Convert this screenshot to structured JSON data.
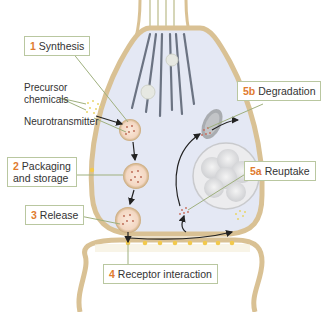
{
  "diagram": {
    "type": "synaptic transmission process",
    "colors": {
      "membrane": "#d9c194",
      "membrane_edge": "#c4a874",
      "cytoplasm": "#e4e8f4",
      "microtubule": "#6b7382",
      "step_number": "#e07b2f",
      "leader_line": "#9fb07e",
      "vesicle_fill": "#f6dcc8",
      "receptor_dot": "#f2c94c"
    },
    "steps": [
      {
        "number": "1",
        "label": "Synthesis"
      },
      {
        "number": "2",
        "label_line1": "Packaging",
        "label_line2": "and storage"
      },
      {
        "number": "3",
        "label": "Release"
      },
      {
        "number": "4",
        "label": "Receptor interaction"
      },
      {
        "number": "5a",
        "label": "Reuptake"
      },
      {
        "number": "5b",
        "label": "Degradation"
      }
    ],
    "annotations": {
      "precursor_line1": "Precursor",
      "precursor_line2": "chemicals",
      "neurotransmitter": "Neurotransmitter"
    }
  }
}
